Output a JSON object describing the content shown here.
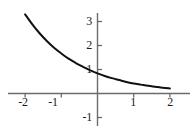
{
  "chart_data": {
    "type": "line",
    "title": "",
    "subtitle": "",
    "xlabel": "",
    "ylabel": "",
    "xlim": [
      -2.45,
      2.45
    ],
    "ylim": [
      -1.6,
      3.5
    ],
    "grid": false,
    "legend": null,
    "annotations": [],
    "axes": {
      "x_ticks": [
        -2,
        -1,
        1,
        2
      ],
      "x_tick_labels": [
        "-2",
        "-1",
        "1",
        "2"
      ],
      "y_ticks": [
        -1,
        1,
        2,
        3
      ],
      "y_tick_labels": [
        "-1",
        "1",
        "2",
        "3"
      ],
      "origin_label": "",
      "x_axis_color": "#6b6b6b",
      "y_axis_color": "#6b6b6b"
    },
    "series": [
      {
        "name": "exponential-decay",
        "color": "#111111",
        "x": [
          -2.0,
          -1.8,
          -1.6,
          -1.4,
          -1.2,
          -1.0,
          -0.8,
          -0.6,
          -0.4,
          -0.2,
          0.0,
          0.2,
          0.4,
          0.6,
          0.8,
          1.0,
          1.2,
          1.4,
          1.6,
          1.8,
          2.0
        ],
        "y": [
          3.3,
          2.88,
          2.51,
          2.19,
          1.91,
          1.67,
          1.45,
          1.27,
          1.11,
          0.96,
          0.84,
          0.73,
          0.64,
          0.56,
          0.48,
          0.42,
          0.37,
          0.32,
          0.28,
          0.24,
          0.21
        ]
      }
    ]
  },
  "labels": {
    "y3": "3",
    "y2": "2",
    "y1": "1",
    "ym1": "-1",
    "xm2": "-2",
    "xm1": "-1",
    "x1": "1",
    "x2": "2"
  }
}
